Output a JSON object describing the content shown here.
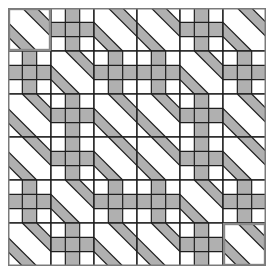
{
  "game": {
    "name": "Tile path puzzle",
    "grid": {
      "rows": 6,
      "cols": 6,
      "tile_size": 43,
      "subdivisions": 3
    },
    "tile_types": {
      "D": "diagonal-bands",
      "C": "cross"
    },
    "tiles": [
      [
        "D",
        "C",
        "D",
        "D",
        "C",
        "D"
      ],
      [
        "C",
        "D",
        "C",
        "C",
        "D",
        "C"
      ],
      [
        "D",
        "C",
        "D",
        "D",
        "C",
        "D"
      ],
      [
        "D",
        "C",
        "D",
        "D",
        "C",
        "D"
      ],
      [
        "C",
        "D",
        "C",
        "C",
        "D",
        "C"
      ],
      [
        "D",
        "C",
        "D",
        "D",
        "C",
        "D"
      ]
    ],
    "highlighted_tiles": [
      {
        "row": 0,
        "col": 0,
        "role": "start"
      },
      {
        "row": 5,
        "col": 5,
        "role": "end"
      }
    ],
    "colors": {
      "background": "#ffffff",
      "path_fill": "#b0b0b0",
      "line": "#1e1e1e",
      "outer_border": "#7a7a7a",
      "highlight_border": "#8a8a8a"
    }
  }
}
